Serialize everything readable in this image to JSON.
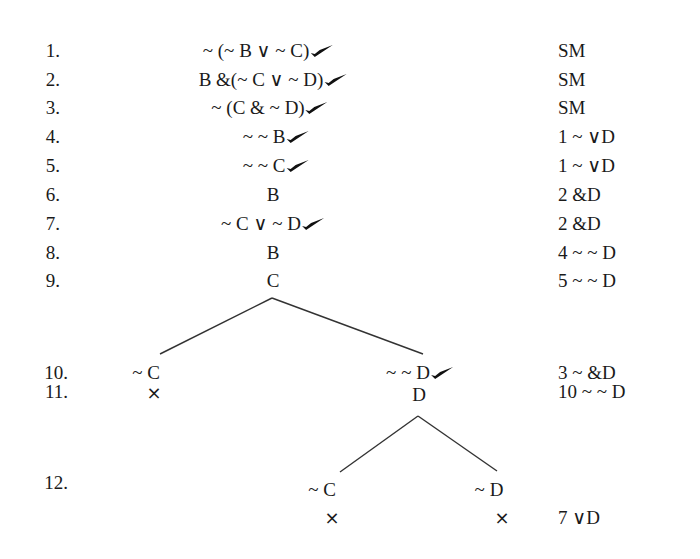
{
  "proof": {
    "rows": [
      {
        "num": "1.",
        "formula": "~ (~ B ∨ ~ C)",
        "checked": true,
        "justification": "SM"
      },
      {
        "num": "2.",
        "formula": "B &(~ C ∨ ~ D)",
        "checked": true,
        "justification": "SM"
      },
      {
        "num": "3.",
        "formula": "~ (C & ~ D)",
        "checked": true,
        "justification": "SM"
      },
      {
        "num": "4.",
        "formula": "~ ~ B",
        "checked": true,
        "justification": "1 ~ ∨D"
      },
      {
        "num": "5.",
        "formula": "~ ~ C",
        "checked": true,
        "justification": "1 ~ ∨D"
      },
      {
        "num": "6.",
        "formula": "B",
        "checked": false,
        "justification": "2 &D"
      },
      {
        "num": "7.",
        "formula": "~ C ∨ ~ D",
        "checked": true,
        "justification": "2 &D"
      },
      {
        "num": "8.",
        "formula": "B",
        "checked": false,
        "justification": "4 ~ ~ D"
      },
      {
        "num": "9.",
        "formula": "C",
        "checked": false,
        "justification": "5 ~ ~ D"
      }
    ],
    "branch1": {
      "num": "10.",
      "left": "~ C",
      "right": "~ ~ D",
      "right_checked": true,
      "justification": "3 ~ &D"
    },
    "row11": {
      "num": "11.",
      "left_close": "×",
      "right": "D",
      "justification": "10 ~ ~ D"
    },
    "branch2": {
      "num": "12.",
      "left": "~ C",
      "right": "~ D",
      "left_close": "×",
      "right_close": "×",
      "justification": "7 ∨D"
    }
  },
  "icons": {
    "check": "checkmark-icon",
    "close": "branch-closed-x"
  }
}
